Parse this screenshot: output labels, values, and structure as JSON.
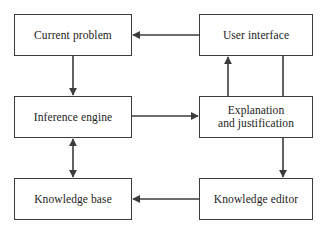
{
  "diagram": {
    "background_color": "#fefefe",
    "line_color": "#3c3c3c",
    "text_color": "#1c1c1c",
    "nodes": [
      {
        "id": "current-problem",
        "label": "Current problem"
      },
      {
        "id": "user-interface",
        "label": "User interface"
      },
      {
        "id": "inference-engine",
        "label": "Inference engine"
      },
      {
        "id": "explanation",
        "label": "Explanation\nand justification"
      },
      {
        "id": "knowledge-base",
        "label": "Knowledge base"
      },
      {
        "id": "knowledge-editor",
        "label": "Knowledge editor"
      }
    ],
    "edges": [
      {
        "id": "user-interface-to-current-problem",
        "from": "user-interface",
        "to": "current-problem",
        "direction": "single",
        "orientation": "horizontal"
      },
      {
        "id": "current-problem-to-inference-engine",
        "from": "current-problem",
        "to": "inference-engine",
        "direction": "single",
        "orientation": "vertical"
      },
      {
        "id": "inference-engine-to-explanation",
        "from": "inference-engine",
        "to": "explanation",
        "direction": "single",
        "orientation": "horizontal"
      },
      {
        "id": "inference-engine-knowledge-base",
        "from": "inference-engine",
        "to": "knowledge-base",
        "direction": "double",
        "orientation": "vertical"
      },
      {
        "id": "explanation-to-user-interface",
        "from": "explanation",
        "to": "user-interface",
        "direction": "single",
        "orientation": "vertical"
      },
      {
        "id": "user-interface-to-explanation",
        "from": "user-interface",
        "to": "explanation",
        "direction": "none",
        "orientation": "vertical"
      },
      {
        "id": "explanation-to-knowledge-editor",
        "from": "explanation",
        "to": "knowledge-editor",
        "direction": "single",
        "orientation": "vertical"
      },
      {
        "id": "knowledge-editor-to-knowledge-base",
        "from": "knowledge-editor",
        "to": "knowledge-base",
        "direction": "single",
        "orientation": "horizontal"
      }
    ]
  }
}
